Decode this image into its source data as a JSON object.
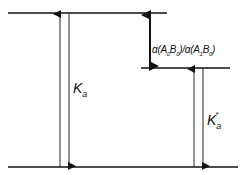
{
  "diagram": {
    "type": "energy-level diagram",
    "levels": [
      {
        "name": "top-level",
        "y": 13,
        "x1": 8,
        "x2": 167
      },
      {
        "name": "middle-level",
        "y": 68,
        "x1": 141,
        "x2": 230
      },
      {
        "name": "bottom-level",
        "y": 167,
        "x1": 8,
        "x2": 238
      }
    ],
    "labels": {
      "ka_main": "K",
      "ka_sub": "a",
      "ka_star_main": "K",
      "ka_star_sub": "a",
      "ka_star_sup": "*",
      "ratio_alpha1": "α(A",
      "ratio_sub0a": "0",
      "ratio_b1": "B",
      "ratio_sub0b": "0",
      "ratio_mid": ")/α(A",
      "ratio_sub1": "1",
      "ratio_b2": "B",
      "ratio_sub0c": "0",
      "ratio_end": ")"
    },
    "colors": {
      "line": "#111111",
      "background": "#ffffff"
    }
  }
}
